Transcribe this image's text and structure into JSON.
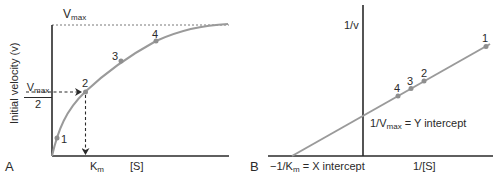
{
  "colors": {
    "axis": "#2a2a2a",
    "curve": "#9a9a9a",
    "point": "#8f8f8f",
    "dashed": "#2a2a2a",
    "text": "#2a2a2a"
  },
  "panel_a": {
    "panel_label": "A",
    "y_axis_label": "Initial velocity (v)",
    "x_axis_label": "[S]",
    "vmax_label": {
      "main": "V",
      "sub": "max"
    },
    "half_vmax_label": {
      "num_main": "V",
      "num_sub": "max",
      "den": "2"
    },
    "km_label": {
      "main": "K",
      "sub": "m"
    },
    "points": [
      {
        "id": "1",
        "label": "1"
      },
      {
        "id": "2",
        "label": "2"
      },
      {
        "id": "3",
        "label": "3"
      },
      {
        "id": "4",
        "label": "4"
      }
    ]
  },
  "panel_b": {
    "panel_label": "B",
    "y_axis_label": "1/v",
    "x_axis_label": "1/[S]",
    "y_intercept_label": {
      "prefix": "1/V",
      "sub": "max",
      "suffix": " = Y intercept"
    },
    "x_intercept_label": {
      "prefix": "−1/K",
      "sub": "m",
      "suffix": " = X intercept"
    },
    "points": [
      {
        "id": "1",
        "label": "1"
      },
      {
        "id": "2",
        "label": "2"
      },
      {
        "id": "3",
        "label": "3"
      },
      {
        "id": "4",
        "label": "4"
      }
    ]
  }
}
